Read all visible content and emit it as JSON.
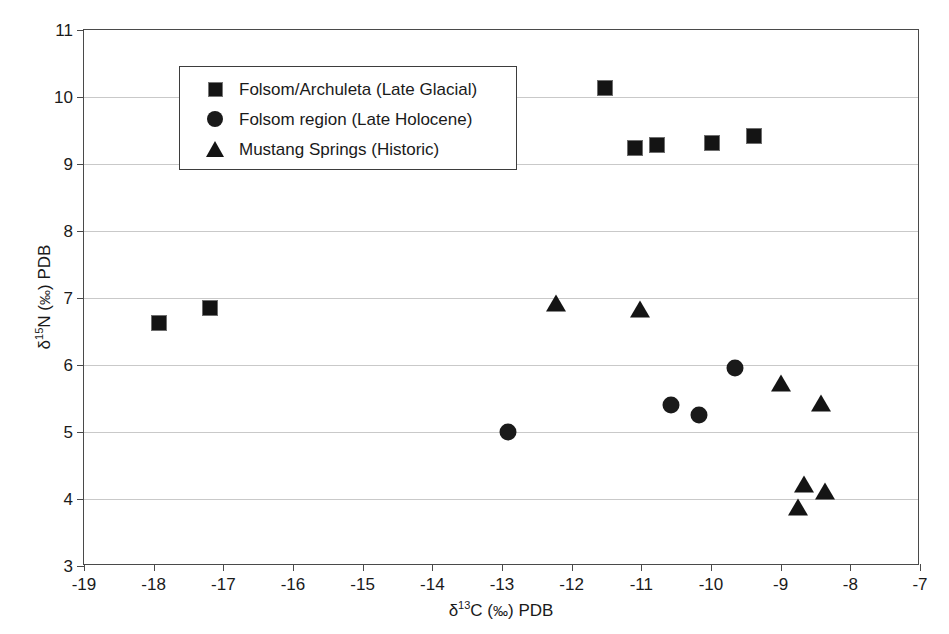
{
  "chart_data": {
    "type": "scatter",
    "title": "",
    "xlabel": "δ13C (0/00) PDB",
    "ylabel": "δ15N (0/00) PDB",
    "xlim": [
      -19,
      -7
    ],
    "ylim": [
      3,
      11
    ],
    "xticks": [
      -19,
      -18,
      -17,
      -16,
      -15,
      -14,
      -13,
      -12,
      -11,
      -10,
      -9,
      -8,
      -7
    ],
    "yticks": [
      3,
      4,
      5,
      6,
      7,
      8,
      9,
      10,
      11
    ],
    "xtick_labels": [
      "-19",
      "-18",
      "-17",
      "-16",
      "-15",
      "-14",
      "-13",
      "-12",
      "-11",
      "-10",
      "-9",
      "-8",
      "-7"
    ],
    "ytick_labels": [
      "3",
      "4",
      "5",
      "6",
      "7",
      "8",
      "9",
      "10",
      "11"
    ],
    "grid": "horizontal",
    "legend_position": "upper-left-inside",
    "series": [
      {
        "name": "Folsom/Archuleta (Late Glacial)",
        "marker": "square",
        "color": "#141414",
        "points": [
          {
            "x": -17.93,
            "y": 6.62
          },
          {
            "x": -17.19,
            "y": 6.85
          },
          {
            "x": -13.05,
            "y": 9.12
          },
          {
            "x": -11.52,
            "y": 10.13
          },
          {
            "x": -11.09,
            "y": 9.24
          },
          {
            "x": -10.77,
            "y": 9.28
          },
          {
            "x": -9.99,
            "y": 9.31
          },
          {
            "x": -9.38,
            "y": 9.42
          }
        ]
      },
      {
        "name": "Folsom region (Late Holocene)",
        "marker": "circle",
        "color": "#1a1a1a",
        "points": [
          {
            "x": -12.92,
            "y": 5.0
          },
          {
            "x": -10.58,
            "y": 5.4
          },
          {
            "x": -10.17,
            "y": 5.26
          },
          {
            "x": -9.65,
            "y": 5.96
          }
        ]
      },
      {
        "name": "Mustang Springs (Historic)",
        "marker": "triangle",
        "color": "#141414",
        "points": [
          {
            "x": -12.22,
            "y": 6.9
          },
          {
            "x": -11.02,
            "y": 6.8
          },
          {
            "x": -9.0,
            "y": 5.7
          },
          {
            "x": -8.42,
            "y": 5.4
          },
          {
            "x": -8.66,
            "y": 4.2
          },
          {
            "x": -8.37,
            "y": 4.09
          },
          {
            "x": -8.75,
            "y": 3.85
          }
        ]
      }
    ]
  },
  "legend": {
    "entries": [
      {
        "label": "Folsom/Archuleta (Late Glacial)",
        "marker": "square"
      },
      {
        "label": "Folsom region (Late Holocene)",
        "marker": "circle"
      },
      {
        "label": "Mustang Springs (Historic)",
        "marker": "triangle"
      }
    ]
  }
}
